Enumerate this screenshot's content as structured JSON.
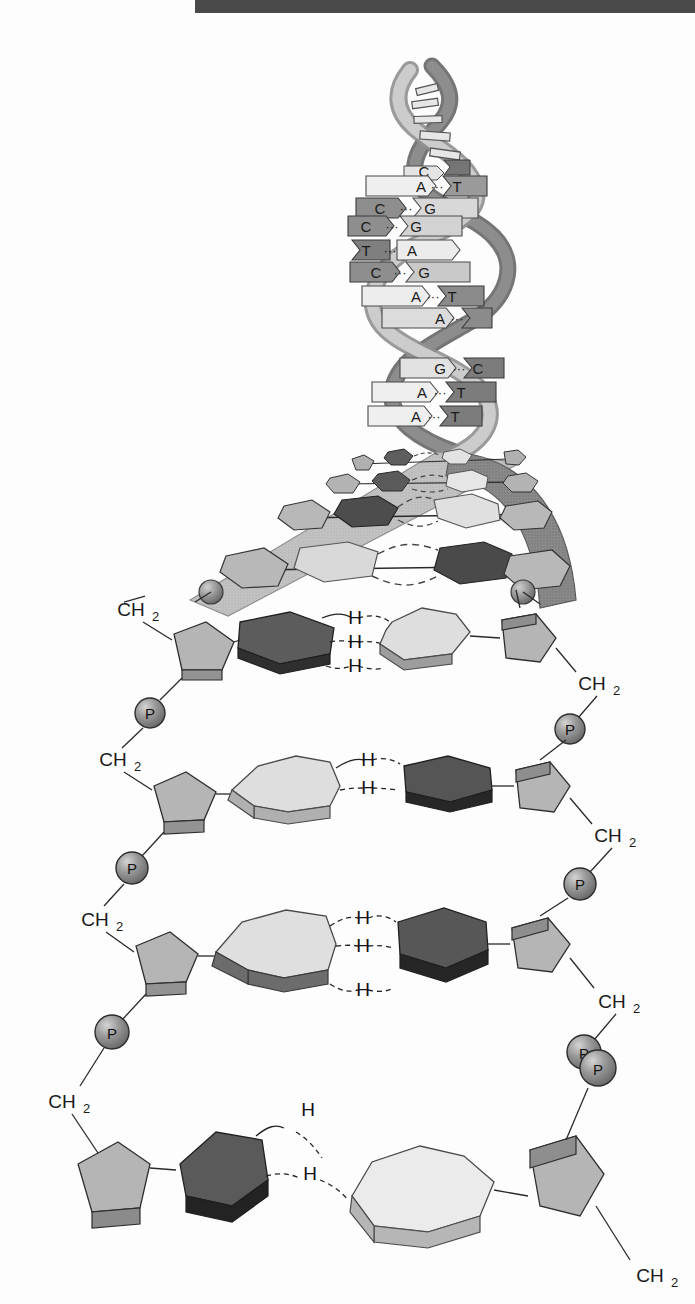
{
  "figure": {
    "top_bar_color": "#4a4a4a",
    "background_color": "#fdfdfd"
  },
  "palette": {
    "ribbon_light": "#bdbdbd",
    "ribbon_light_edge": "#7d7d7d",
    "ribbon_dark": "#8a8a8a",
    "ribbon_dark_edge": "#4f4f4f",
    "sugar_fill": "#b5b5b5",
    "sugar_edge": "#3a3a3a",
    "sugar_side": "#8f8f8f",
    "base_light": "#dcdcdc",
    "base_light_side": "#9a9a9a",
    "base_mid": "#8c8c8c",
    "base_dark": "#5c5c5c",
    "base_darkest": "#2f2f2f",
    "phosphate_fill": "#8e8e8e",
    "phosphate_edge": "#2c2c2c",
    "line_color": "#2a2a2a",
    "bond_color": "#1c1c1c"
  },
  "helix": {
    "label": "DNA double helix",
    "base_pairs": [
      {
        "left": "C",
        "right": "G",
        "dots": "···"
      },
      {
        "left": "A",
        "right": "T",
        "dots": "···"
      },
      {
        "left": "C",
        "right": "G",
        "dots": "···"
      },
      {
        "left": "C",
        "right": "G",
        "dots": "···"
      },
      {
        "left": "T",
        "right": "A",
        "dots": "···"
      },
      {
        "left": "C",
        "right": "G",
        "dots": "···"
      },
      {
        "left": "A",
        "right": "T",
        "dots": "···"
      },
      {
        "left": "A",
        "right": "T",
        "dots": "···"
      },
      {
        "left": "G",
        "right": "C",
        "dots": "···"
      },
      {
        "left": "A",
        "right": "T",
        "dots": "···"
      },
      {
        "left": "A",
        "right": "T",
        "dots": "···"
      }
    ]
  },
  "backbone": {
    "ch2_label": "CH",
    "ch2_subscript": "2",
    "phosphate_label": "P",
    "left_ch2_count": 4,
    "right_ch2_count": 4,
    "left_phosphate_count": 3,
    "right_phosphate_count": 3
  },
  "hydrogen_bond": {
    "label": "H",
    "style": "dashed"
  },
  "ladder_rungs": [
    {
      "name": "rung-1",
      "left_base_type": "pyrimidine-dark-hexagon",
      "right_base_type": "purine-light-fused",
      "hydrogen_bonds": 3,
      "bond_labels": [
        "H",
        "H",
        "H"
      ]
    },
    {
      "name": "rung-2",
      "left_base_type": "purine-light-fused",
      "right_base_type": "pyrimidine-dark-hexagon",
      "hydrogen_bonds": 2,
      "bond_labels": [
        "H",
        "H"
      ]
    },
    {
      "name": "rung-3",
      "left_base_type": "purine-light-fused",
      "right_base_type": "pyrimidine-dark-hexagon",
      "hydrogen_bonds": 3,
      "bond_labels": [
        "H",
        "H",
        "H"
      ]
    },
    {
      "name": "rung-4",
      "left_base_type": "pyrimidine-dark-hexagon",
      "right_base_type": "purine-light-fused",
      "hydrogen_bonds": 2,
      "bond_labels": [
        "H",
        "H"
      ]
    }
  ],
  "transition_fan": {
    "description": "Unwinding zone where the helix ribbons splay open into the flat ladder",
    "rung_count": 4,
    "dashed_bond_rows": 4
  }
}
